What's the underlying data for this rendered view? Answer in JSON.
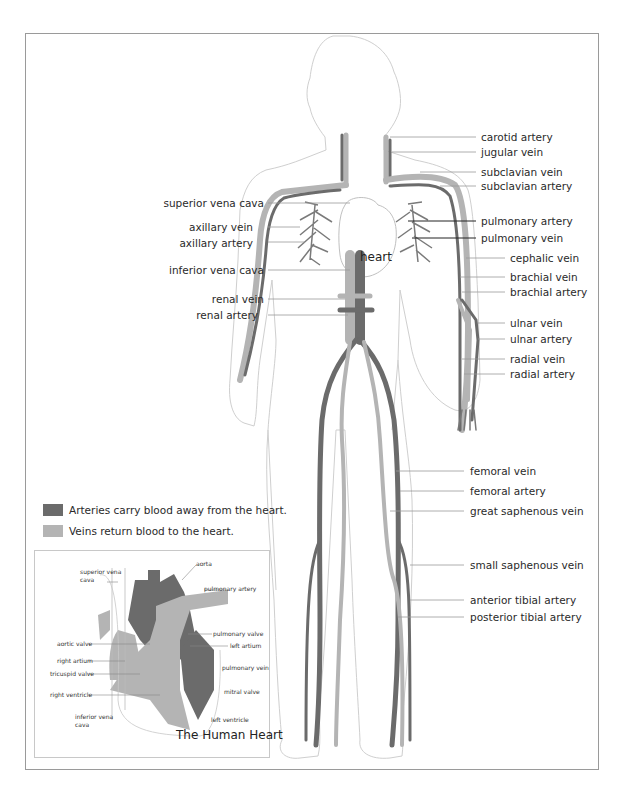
{
  "colors": {
    "artery": "#6b6b6b",
    "vein": "#b4b4b4",
    "outline": "#c8c8c8",
    "leader": "#9a9a9a",
    "frame": "#9a9a9a"
  },
  "body_center_label": "heart",
  "left_labels": [
    {
      "id": "superior-vena-cava",
      "text": "superior vena cava",
      "y": 197
    },
    {
      "id": "axillary-vein",
      "text": "axillary vein",
      "y": 221
    },
    {
      "id": "axillary-artery",
      "text": "axillary artery",
      "y": 237
    },
    {
      "id": "inferior-vena-cava",
      "text": "inferior vena cava",
      "y": 264
    },
    {
      "id": "renal-vein",
      "text": "renal vein",
      "y": 293
    },
    {
      "id": "renal-artery",
      "text": "renal artery",
      "y": 309
    }
  ],
  "right_labels": [
    {
      "id": "carotid-artery",
      "text": "carotid artery",
      "x": 481,
      "y": 131
    },
    {
      "id": "jugular-vein",
      "text": "jugular vein",
      "x": 481,
      "y": 146
    },
    {
      "id": "subclavian-vein",
      "text": "subclavian vein",
      "x": 481,
      "y": 166
    },
    {
      "id": "subclavian-artery",
      "text": "subclavian artery",
      "x": 481,
      "y": 180
    },
    {
      "id": "pulmonary-artery",
      "text": "pulmonary artery",
      "x": 481,
      "y": 215
    },
    {
      "id": "pulmonary-vein",
      "text": "pulmonary vein",
      "x": 481,
      "y": 232
    },
    {
      "id": "cephalic-vein",
      "text": "cephalic vein",
      "x": 510,
      "y": 252
    },
    {
      "id": "brachial-vein",
      "text": "brachial vein",
      "x": 510,
      "y": 271
    },
    {
      "id": "brachial-artery",
      "text": "brachial artery",
      "x": 510,
      "y": 286
    },
    {
      "id": "ulnar-vein",
      "text": "ulnar vein",
      "x": 510,
      "y": 317
    },
    {
      "id": "ulnar-artery",
      "text": "ulnar artery",
      "x": 510,
      "y": 333
    },
    {
      "id": "radial-vein",
      "text": "radial vein",
      "x": 510,
      "y": 353
    },
    {
      "id": "radial-artery",
      "text": "radial artery",
      "x": 510,
      "y": 368
    },
    {
      "id": "femoral-vein",
      "text": "femoral vein",
      "x": 470,
      "y": 465
    },
    {
      "id": "femoral-artery",
      "text": "femoral artery",
      "x": 470,
      "y": 485
    },
    {
      "id": "great-saphenous-vein",
      "text": "great saphenous vein",
      "x": 470,
      "y": 505
    },
    {
      "id": "small-saphenous-vein",
      "text": "small saphenous vein",
      "x": 470,
      "y": 559
    },
    {
      "id": "anterior-tibial-artery",
      "text": "anterior tibial artery",
      "x": 470,
      "y": 594
    },
    {
      "id": "posterior-tibial-artery",
      "text": "posterior tibial artery",
      "x": 470,
      "y": 611
    }
  ],
  "legend": {
    "artery": "Arteries carry blood away from the heart.",
    "vein": "Veins return blood to the heart."
  },
  "heart_inset": {
    "title": "The Human Heart",
    "labels": [
      {
        "id": "superior-vena-cava",
        "text": "superior vena\ncava",
        "x": 80,
        "y": 569
      },
      {
        "id": "aorta",
        "text": "aorta",
        "x": 196,
        "y": 560
      },
      {
        "id": "pulmonary-artery",
        "text": "pulmonary artery",
        "x": 204,
        "y": 585
      },
      {
        "id": "pulmonary-valve",
        "text": "pulmonary valve",
        "x": 213,
        "y": 630
      },
      {
        "id": "left-artium",
        "text": "left artium",
        "x": 230,
        "y": 642
      },
      {
        "id": "aortic-valve",
        "text": "aortic valve",
        "x": 57,
        "y": 640
      },
      {
        "id": "right-artium",
        "text": "right artium",
        "x": 57,
        "y": 657
      },
      {
        "id": "tricuspid-valve",
        "text": "tricuspid valve",
        "x": 50,
        "y": 670
      },
      {
        "id": "pulmonary-vein",
        "text": "pulmonary vein",
        "x": 222,
        "y": 664
      },
      {
        "id": "right-ventricle",
        "text": "right ventricle",
        "x": 50,
        "y": 691
      },
      {
        "id": "mitral-valve",
        "text": "mitral valve",
        "x": 224,
        "y": 688
      },
      {
        "id": "inferior-vena-cava",
        "text": "inferior vena\ncava",
        "x": 75,
        "y": 714
      },
      {
        "id": "left-ventricle",
        "text": "left ventricle",
        "x": 211,
        "y": 716
      }
    ]
  }
}
